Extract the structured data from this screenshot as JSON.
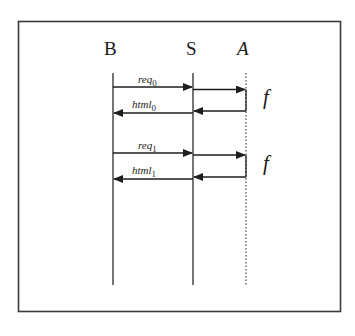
{
  "actors": [
    {
      "id": "B",
      "label": "B",
      "italic": false
    },
    {
      "id": "S",
      "label": "S",
      "italic": false
    },
    {
      "id": "A",
      "label": "A",
      "italic": true
    }
  ],
  "messages": [
    {
      "name": "req",
      "sub": "0",
      "from": "B",
      "to": "S"
    },
    {
      "name": "html",
      "sub": "0",
      "from": "S",
      "to": "B"
    },
    {
      "name": "req",
      "sub": "1",
      "from": "B",
      "to": "S"
    },
    {
      "name": "html",
      "sub": "1",
      "from": "S",
      "to": "B"
    }
  ],
  "function_calls": [
    {
      "label": "f",
      "from": "S",
      "to": "A"
    },
    {
      "label": "f",
      "from": "S",
      "to": "A"
    }
  ]
}
